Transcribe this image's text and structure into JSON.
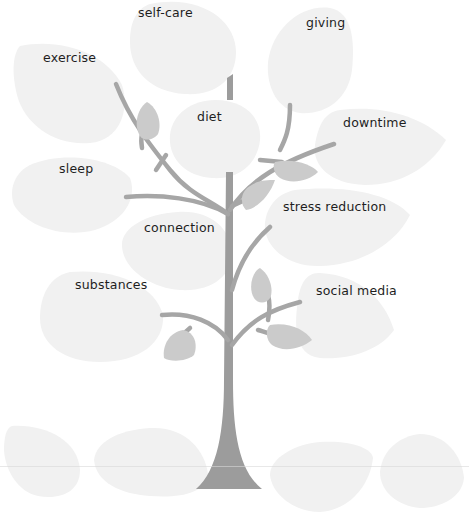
{
  "diagram": {
    "type": "wellness-tree",
    "colors": {
      "large_leaf": "#f1f1f1",
      "small_leaf": "#cbcbcb",
      "branch": "#a6a6a6",
      "trunk": "#9c9c9c",
      "text": "#1e1e1e"
    },
    "leaves": [
      {
        "id": "self-care",
        "label": "self-care"
      },
      {
        "id": "giving",
        "label": "giving"
      },
      {
        "id": "exercise",
        "label": "exercise"
      },
      {
        "id": "diet",
        "label": "diet"
      },
      {
        "id": "downtime",
        "label": "downtime"
      },
      {
        "id": "sleep",
        "label": "sleep"
      },
      {
        "id": "stress-reduction",
        "label": "stress reduction"
      },
      {
        "id": "connection",
        "label": "connection"
      },
      {
        "id": "substances",
        "label": "substances"
      },
      {
        "id": "social-media",
        "label": "social media"
      },
      {
        "id": "blank-1",
        "label": ""
      },
      {
        "id": "blank-2",
        "label": ""
      },
      {
        "id": "blank-3",
        "label": ""
      },
      {
        "id": "blank-4",
        "label": ""
      }
    ]
  }
}
